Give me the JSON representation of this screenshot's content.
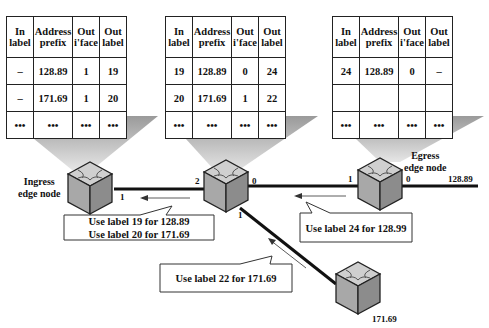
{
  "tables": [
    {
      "headers": [
        "In label",
        "Address prefix",
        "Out i'face",
        "Out label"
      ],
      "rows": [
        [
          "–",
          "128.89",
          "1",
          "19"
        ],
        [
          "–",
          "171.69",
          "1",
          "20"
        ],
        [
          "•••",
          "•••",
          "•••",
          "•••"
        ]
      ]
    },
    {
      "headers": [
        "In label",
        "Address prefix",
        "Out i'face",
        "Out label"
      ],
      "rows": [
        [
          "19",
          "128.89",
          "0",
          "24"
        ],
        [
          "20",
          "171.69",
          "1",
          "22"
        ],
        [
          "•••",
          "•••",
          "•••",
          "•••"
        ]
      ]
    },
    {
      "headers": [
        "In label",
        "Address prefix",
        "Out i'face",
        "Out label"
      ],
      "rows": [
        [
          "24",
          "128.89",
          "0",
          "–"
        ],
        [
          "",
          "",
          "",
          ""
        ],
        [
          "•••",
          "•••",
          "•••",
          "•••"
        ]
      ]
    }
  ],
  "nodes": {
    "ingress_label_1": "Ingress",
    "ingress_label_2": "edge node",
    "egress_label_1": "Egress",
    "egress_label_2": "edge node"
  },
  "ports": {
    "ingress_1": "1",
    "core_2": "2",
    "core_0": "0",
    "core_1": "1",
    "egress_1": "1",
    "egress_0": "0"
  },
  "destinations": {
    "egress_dest": "128.89",
    "bottom_dest": "171.69"
  },
  "callouts": {
    "ingress_line1": "Use label 19 for 128.89",
    "ingress_line2": "Use label 20 for 171.69",
    "egress": "Use label 24 for 128.99",
    "bottom": "Use label 22 for 171.69"
  }
}
